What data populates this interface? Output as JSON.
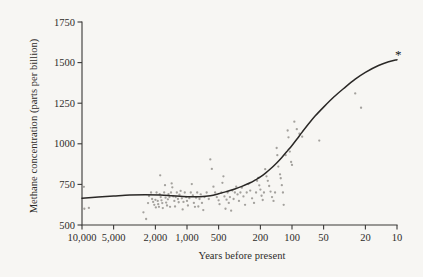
{
  "chart_data": {
    "type": "scatter",
    "title": "",
    "subtitle": "",
    "xlabel": "Years before present",
    "ylabel": "Methane concentration (parts per billion)",
    "x_scale": "log-reversed",
    "xlim": [
      10000,
      10
    ],
    "ylim": [
      500,
      1750
    ],
    "grid": false,
    "legend": null,
    "xticks": [
      {
        "value": 10000,
        "label": "10,000"
      },
      {
        "value": 5000,
        "label": "5,000"
      },
      {
        "value": 2000,
        "label": "2,000"
      },
      {
        "value": 1000,
        "label": "1,000"
      },
      {
        "value": 500,
        "label": "500"
      },
      {
        "value": 200,
        "label": "200"
      },
      {
        "value": 100,
        "label": "100"
      },
      {
        "value": 50,
        "label": "50"
      },
      {
        "value": 20,
        "label": "20"
      },
      {
        "value": 10,
        "label": "10"
      }
    ],
    "yticks": [
      {
        "value": 500,
        "label": "500"
      },
      {
        "value": 750,
        "label": "750"
      },
      {
        "value": 1000,
        "label": "1000"
      },
      {
        "value": 1250,
        "label": "1250"
      },
      {
        "value": 1500,
        "label": "1500"
      },
      {
        "value": 1750,
        "label": "1750"
      }
    ],
    "colors": {
      "axis": "#3a3836",
      "curve": "#2a2826",
      "points": "#9a9893",
      "marker": "#141414",
      "background": "#f7f6f3",
      "text": "#2e2c2a"
    },
    "series": [
      {
        "name": "Ice core methane measurements",
        "type": "scatter",
        "marker": "dot",
        "points": [
          [
            9600,
            735
          ],
          [
            9500,
            600
          ],
          [
            8600,
            605
          ],
          [
            2600,
            578
          ],
          [
            2450,
            537
          ],
          [
            2350,
            635
          ],
          [
            2300,
            678
          ],
          [
            2200,
            700
          ],
          [
            2150,
            660
          ],
          [
            2100,
            642
          ],
          [
            2050,
            624
          ],
          [
            2000,
            655
          ],
          [
            1980,
            608
          ],
          [
            1950,
            700
          ],
          [
            1900,
            648
          ],
          [
            1880,
            628
          ],
          [
            1850,
            612
          ],
          [
            1820,
            690
          ],
          [
            1800,
            806
          ],
          [
            1780,
            672
          ],
          [
            1750,
            652
          ],
          [
            1720,
            635
          ],
          [
            1700,
            604
          ],
          [
            1650,
            700
          ],
          [
            1620,
            745
          ],
          [
            1600,
            668
          ],
          [
            1580,
            638
          ],
          [
            1550,
            620
          ],
          [
            1520,
            658
          ],
          [
            1500,
            690
          ],
          [
            1470,
            672
          ],
          [
            1450,
            612
          ],
          [
            1420,
            700
          ],
          [
            1400,
            756
          ],
          [
            1380,
            732
          ],
          [
            1350,
            676
          ],
          [
            1320,
            648
          ],
          [
            1300,
            614
          ],
          [
            1280,
            672
          ],
          [
            1250,
            700
          ],
          [
            1220,
            660
          ],
          [
            1200,
            640
          ],
          [
            1180,
            687
          ],
          [
            1150,
            710
          ],
          [
            1120,
            664
          ],
          [
            1100,
            596
          ],
          [
            1080,
            642
          ],
          [
            1050,
            700
          ],
          [
            1020,
            672
          ],
          [
            1000,
            648
          ],
          [
            980,
            620
          ],
          [
            950,
            665
          ],
          [
            920,
            700
          ],
          [
            900,
            752
          ],
          [
            880,
            682
          ],
          [
            860,
            636
          ],
          [
            840,
            612
          ],
          [
            820,
            668
          ],
          [
            800,
            700
          ],
          [
            780,
            614
          ],
          [
            760,
            660
          ],
          [
            740,
            688
          ],
          [
            720,
            636
          ],
          [
            700,
            592
          ],
          [
            680,
            672
          ],
          [
            650,
            700
          ],
          [
            620,
            660
          ],
          [
            600,
            904
          ],
          [
            580,
            845
          ],
          [
            560,
            736
          ],
          [
            540,
            700
          ],
          [
            520,
            672
          ],
          [
            500,
            652
          ],
          [
            490,
            628
          ],
          [
            470,
            700
          ],
          [
            460,
            760
          ],
          [
            450,
            800
          ],
          [
            440,
            676
          ],
          [
            430,
            600
          ],
          [
            420,
            656
          ],
          [
            410,
            700
          ],
          [
            400,
            636
          ],
          [
            390,
            672
          ],
          [
            380,
            588
          ],
          [
            370,
            712
          ],
          [
            360,
            660
          ],
          [
            350,
            700
          ],
          [
            340,
            736
          ],
          [
            330,
            688
          ],
          [
            320,
            648
          ],
          [
            310,
            700
          ],
          [
            300,
            730
          ],
          [
            290,
            676
          ],
          [
            280,
            624
          ],
          [
            270,
            700
          ],
          [
            260,
            752
          ],
          [
            250,
            712
          ],
          [
            240,
            664
          ],
          [
            230,
            636
          ],
          [
            220,
            700
          ],
          [
            215,
            772
          ],
          [
            210,
            790
          ],
          [
            205,
            744
          ],
          [
            200,
            718
          ],
          [
            195,
            680
          ],
          [
            190,
            654
          ],
          [
            185,
            700
          ],
          [
            180,
            844
          ],
          [
            175,
            800
          ],
          [
            170,
            772
          ],
          [
            165,
            740
          ],
          [
            160,
            706
          ],
          [
            155,
            672
          ],
          [
            150,
            648
          ],
          [
            145,
            700
          ],
          [
            140,
            974
          ],
          [
            138,
            930
          ],
          [
            135,
            860
          ],
          [
            130,
            812
          ],
          [
            128,
            788
          ],
          [
            125,
            745
          ],
          [
            122,
            700
          ],
          [
            120,
            624
          ],
          [
            115,
            930
          ],
          [
            110,
            1082
          ],
          [
            108,
            1040
          ],
          [
            105,
            952
          ],
          [
            102,
            888
          ],
          [
            100,
            870
          ],
          [
            95,
            1136
          ],
          [
            90,
            1090
          ],
          [
            85,
            1062
          ],
          [
            80,
            1044
          ],
          [
            55,
            1020
          ],
          [
            25,
            1310
          ],
          [
            22,
            1222
          ]
        ]
      },
      {
        "name": "Fitted trend curve",
        "type": "line",
        "points": [
          [
            10000,
            665
          ],
          [
            7000,
            672
          ],
          [
            5000,
            678
          ],
          [
            3500,
            684
          ],
          [
            2500,
            686
          ],
          [
            1800,
            684
          ],
          [
            1400,
            680
          ],
          [
            1100,
            676
          ],
          [
            900,
            674
          ],
          [
            750,
            674
          ],
          [
            600,
            680
          ],
          [
            500,
            692
          ],
          [
            420,
            706
          ],
          [
            350,
            722
          ],
          [
            300,
            738
          ],
          [
            250,
            760
          ],
          [
            220,
            780
          ],
          [
            200,
            796
          ],
          [
            180,
            818
          ],
          [
            160,
            846
          ],
          [
            140,
            882
          ],
          [
            125,
            916
          ],
          [
            110,
            958
          ],
          [
            100,
            990
          ],
          [
            90,
            1028
          ],
          [
            80,
            1072
          ],
          [
            70,
            1120
          ],
          [
            60,
            1172
          ],
          [
            50,
            1226
          ],
          [
            40,
            1288
          ],
          [
            32,
            1342
          ],
          [
            25,
            1398
          ],
          [
            20,
            1440
          ],
          [
            15,
            1482
          ],
          [
            12,
            1505
          ],
          [
            10,
            1518
          ]
        ]
      }
    ],
    "annotations": [
      {
        "name": "present-day-marker",
        "symbol": "*",
        "x": 10,
        "y": 1518,
        "description": "asterisk at curve terminus marking present-day value"
      }
    ]
  }
}
